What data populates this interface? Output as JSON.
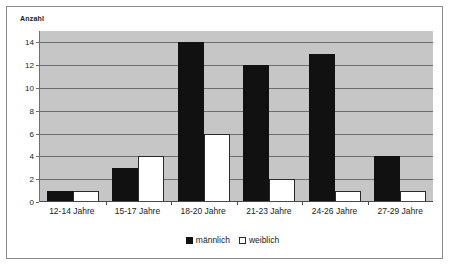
{
  "chart_data": {
    "type": "bar",
    "title": "",
    "xlabel": "",
    "ylabel": "Anzahl",
    "ylim": [
      0,
      15
    ],
    "yticks": [
      0,
      2,
      4,
      6,
      8,
      10,
      12,
      14
    ],
    "grid": true,
    "legend_position": "bottom",
    "categories": [
      "12-14 Jahre",
      "15-17 Jahre",
      "18-20 Jahre",
      "21-23 Jahre",
      "24-26 Jahre",
      "27-29 Jahre"
    ],
    "series": [
      {
        "name": "männlich",
        "color": "#111111",
        "values": [
          1,
          3,
          14,
          12,
          13,
          4
        ]
      },
      {
        "name": "weiblich",
        "color": "#ffffff",
        "values": [
          1,
          4,
          6,
          2,
          1,
          1
        ]
      }
    ]
  },
  "colors": {
    "plot_background": "#c6c6c6",
    "page_background": "#ffffff",
    "gridline": "#6e6e6e",
    "frame_border": "#8a8a8a",
    "text": "#1a1a1a"
  }
}
